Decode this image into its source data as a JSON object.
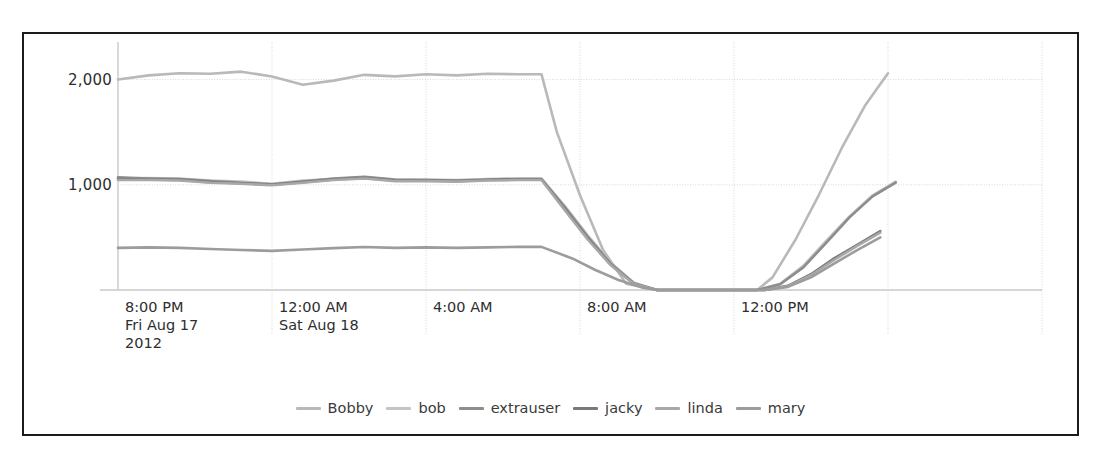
{
  "chart_data": {
    "type": "line",
    "title": "",
    "xlabel": "",
    "ylabel": "",
    "ylim": [
      0,
      2300
    ],
    "yticks": [
      1000,
      2000
    ],
    "ytick_labels": [
      "1,000",
      "2,000"
    ],
    "grid": true,
    "legend_position": "bottom",
    "x_axis_ticks": [
      {
        "time": "8:00 PM",
        "date": "Fri Aug 17",
        "year": "2012"
      },
      {
        "time": "12:00 AM",
        "date": "Sat Aug 18",
        "year": ""
      },
      {
        "time": "4:00 AM",
        "date": "",
        "year": ""
      },
      {
        "time": "8:00 AM",
        "date": "",
        "year": ""
      },
      {
        "time": "12:00 PM",
        "date": "",
        "year": ""
      },
      {
        "time": "",
        "date": "",
        "year": ""
      }
    ],
    "x_hours": [
      16,
      20,
      24,
      28,
      32,
      36,
      40
    ],
    "xlim": [
      16,
      40
    ],
    "series": [
      {
        "name": "Bobby",
        "color": "#b9b9b9",
        "x": [
          16.0,
          16.8,
          17.6,
          18.4,
          19.2,
          20.0,
          20.8,
          21.6,
          22.4,
          23.2,
          24.0,
          24.8,
          25.6,
          26.4,
          27.0,
          27.4,
          28.0,
          28.6,
          29.2,
          30.0,
          31.0,
          32.0,
          32.6,
          33.0,
          33.6,
          34.2,
          34.8,
          35.4,
          36.0
        ],
        "values": [
          2000,
          2040,
          2060,
          2055,
          2075,
          2030,
          1950,
          1990,
          2045,
          2030,
          2050,
          2040,
          2055,
          2050,
          2050,
          1500,
          900,
          380,
          60,
          0,
          0,
          0,
          0,
          120,
          480,
          900,
          1350,
          1750,
          2060
        ]
      },
      {
        "name": "bob",
        "color": "#c4c4c4",
        "x": [
          16.0,
          16.8,
          17.6,
          18.4,
          19.2,
          20.0,
          20.8,
          21.6,
          22.4,
          23.2,
          24.0,
          24.8,
          25.6,
          26.4,
          27.0,
          27.6,
          28.2,
          28.8,
          29.4,
          30.0,
          31.0,
          32.0,
          32.6,
          33.2,
          33.8,
          34.4,
          35.0,
          35.6,
          36.2
        ],
        "values": [
          1060,
          1065,
          1060,
          1040,
          1030,
          1010,
          1040,
          1055,
          1070,
          1045,
          1050,
          1045,
          1055,
          1060,
          1060,
          800,
          520,
          260,
          70,
          0,
          0,
          0,
          0,
          60,
          230,
          470,
          700,
          900,
          1030
        ]
      },
      {
        "name": "extrauser",
        "color": "#8d8d8d",
        "x": [
          16.0,
          16.8,
          17.6,
          18.4,
          19.2,
          20.0,
          20.8,
          21.6,
          22.4,
          23.2,
          24.0,
          24.8,
          25.6,
          26.4,
          27.0,
          27.6,
          28.2,
          28.8,
          29.4,
          30.0,
          31.0,
          32.0,
          32.6,
          33.2,
          33.8,
          34.4,
          35.0,
          35.6,
          36.2
        ],
        "values": [
          1070,
          1060,
          1055,
          1035,
          1020,
          1005,
          1030,
          1060,
          1075,
          1050,
          1045,
          1040,
          1050,
          1055,
          1055,
          790,
          505,
          250,
          65,
          0,
          0,
          0,
          0,
          55,
          215,
          450,
          690,
          890,
          1020
        ]
      },
      {
        "name": "jacky",
        "color": "#7a7a7a",
        "x": [
          16.0,
          16.8,
          17.6,
          18.4,
          19.2,
          20.0,
          20.8,
          21.6,
          22.4,
          23.2,
          24.0,
          24.8,
          25.6,
          26.4,
          27.0,
          27.6,
          28.2,
          28.8,
          29.4,
          30.0,
          31.0,
          32.0,
          32.8,
          33.4,
          34.0,
          34.6,
          35.2,
          35.8
        ],
        "values": [
          1055,
          1050,
          1045,
          1025,
          1015,
          1000,
          1025,
          1050,
          1065,
          1040,
          1040,
          1035,
          1045,
          1050,
          1050,
          770,
          490,
          240,
          60,
          0,
          0,
          0,
          0,
          40,
          150,
          300,
          430,
          560
        ]
      },
      {
        "name": "linda",
        "color": "#a8a8a8",
        "x": [
          16.0,
          16.8,
          17.6,
          18.4,
          19.2,
          20.0,
          20.8,
          21.6,
          22.4,
          23.2,
          24.0,
          24.8,
          25.6,
          26.4,
          27.0,
          27.6,
          28.2,
          28.8,
          29.4,
          30.0,
          31.0,
          32.0,
          32.8,
          33.4,
          34.0,
          34.6,
          35.2,
          35.8
        ],
        "values": [
          1045,
          1045,
          1040,
          1020,
          1010,
          995,
          1020,
          1045,
          1060,
          1035,
          1035,
          1030,
          1040,
          1045,
          1045,
          760,
          480,
          235,
          58,
          0,
          0,
          0,
          0,
          35,
          140,
          285,
          420,
          545
        ]
      },
      {
        "name": "mary",
        "color": "#9c9c9c",
        "x": [
          16.0,
          16.8,
          17.6,
          18.4,
          19.2,
          20.0,
          20.8,
          21.6,
          22.4,
          23.2,
          24.0,
          24.8,
          25.6,
          26.4,
          27.0,
          27.8,
          28.4,
          29.0,
          29.6,
          30.0,
          31.0,
          32.0,
          32.8,
          33.4,
          34.0,
          34.6,
          35.2,
          35.8
        ],
        "values": [
          400,
          405,
          400,
          390,
          380,
          372,
          385,
          398,
          408,
          400,
          405,
          400,
          405,
          410,
          410,
          300,
          190,
          95,
          25,
          0,
          0,
          0,
          0,
          30,
          120,
          250,
          380,
          500
        ]
      }
    ]
  },
  "legend": {
    "entries": [
      {
        "label": "Bobby"
      },
      {
        "label": "bob"
      },
      {
        "label": "extrauser"
      },
      {
        "label": "jacky"
      },
      {
        "label": "linda"
      },
      {
        "label": "mary"
      }
    ]
  },
  "colors": {
    "frame": "#1b1b1b",
    "axis": "#c9c9c9",
    "grid": "#d8d8d8",
    "text": "#2e2e2e",
    "background": "#ffffff"
  }
}
